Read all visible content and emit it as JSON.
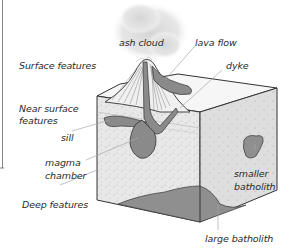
{
  "diagram": {
    "zones": {
      "surface": "Surface features",
      "near_surface_1": "Near surface",
      "near_surface_2": "features",
      "deep": "Deep features"
    },
    "labels": {
      "ash_cloud": "ash cloud",
      "lava_flow": "lava flow",
      "dyke": "dyke",
      "sill": "sill",
      "magma_1": "magma",
      "magma_2": "chamber",
      "smaller_1": "smaller",
      "smaller_2": "batholith",
      "large_batholith": "large batholith"
    },
    "colors": {
      "rock": "#e6e6e6",
      "magma": "#8a8a8a",
      "outline": "#333333",
      "leader": "#aaaaaa",
      "cloud": "#dcdcdc"
    }
  }
}
